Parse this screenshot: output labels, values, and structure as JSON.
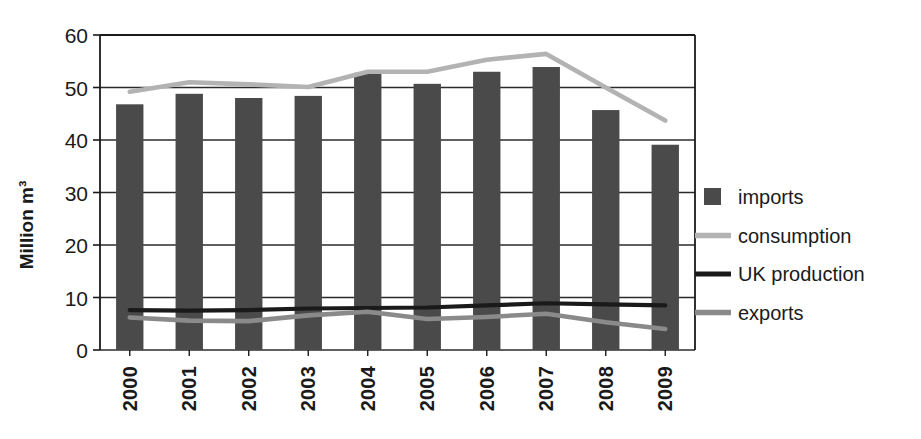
{
  "chart_data": {
    "type": "bar",
    "title": "",
    "subtitle": "",
    "xlabel": "",
    "ylabel": "Million m³",
    "ylim": [
      0,
      60
    ],
    "ytick_step": 10,
    "yticks": [
      "0",
      "10",
      "20",
      "30",
      "40",
      "50",
      "60"
    ],
    "grid": true,
    "grid_axis": "y",
    "legend_position": "right",
    "categories": [
      "2000",
      "2001",
      "2002",
      "2003",
      "2004",
      "2005",
      "2006",
      "2007",
      "2008",
      "2009"
    ],
    "series": [
      {
        "name": "imports",
        "render": "bar",
        "color": "#4a4a4a",
        "values": [
          46.8,
          48.8,
          48.0,
          48.4,
          52.8,
          50.7,
          53.0,
          53.9,
          45.7,
          39.1
        ]
      },
      {
        "name": "consumption",
        "render": "line",
        "color": "#b3b3b3",
        "values": [
          49.2,
          51.0,
          50.6,
          50.1,
          53.0,
          53.0,
          55.3,
          56.4,
          50.0,
          43.7
        ]
      },
      {
        "name": "UK production",
        "render": "line",
        "color": "#1a1a1a",
        "values": [
          7.6,
          7.5,
          7.6,
          7.9,
          8.0,
          8.1,
          8.5,
          8.9,
          8.7,
          8.5
        ]
      },
      {
        "name": "exports",
        "render": "line",
        "color": "#8a8a8a",
        "values": [
          6.2,
          5.6,
          5.5,
          6.6,
          7.3,
          5.9,
          6.3,
          6.9,
          5.3,
          4.0
        ]
      }
    ]
  },
  "legend": {
    "items": [
      {
        "label": "imports",
        "marker": "square",
        "color": "#4a4a4a"
      },
      {
        "label": "consumption",
        "marker": "line",
        "color": "#b3b3b3"
      },
      {
        "label": "UK production",
        "marker": "line",
        "color": "#1a1a1a"
      },
      {
        "label": "exports",
        "marker": "line",
        "color": "#8a8a8a"
      }
    ]
  },
  "axis": {
    "y_title": "Million m³",
    "frame_color": "#1a1a1a",
    "grid_color": "#2b2b2b"
  }
}
